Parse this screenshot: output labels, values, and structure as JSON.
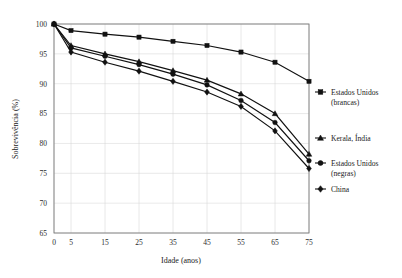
{
  "chart_data": {
    "type": "line",
    "title": "",
    "xlabel": "Idade (anos)",
    "ylabel": "Sobrevivência (%)",
    "xlim": [
      0,
      75
    ],
    "ylim": [
      65,
      100
    ],
    "xticks": [
      0,
      5,
      15,
      25,
      35,
      45,
      55,
      65,
      75
    ],
    "xtick_labels": [
      "0",
      "5",
      "15",
      "25",
      "35",
      "45",
      "55",
      "65",
      "75"
    ],
    "yticks": [
      65,
      70,
      75,
      80,
      85,
      90,
      95,
      100
    ],
    "ytick_labels": [
      "65",
      "70",
      "75",
      "80",
      "85",
      "90",
      "95",
      "100"
    ],
    "grid": true,
    "legend_position": "right",
    "x": [
      0,
      5,
      15,
      25,
      35,
      45,
      55,
      65,
      75
    ],
    "series": [
      {
        "name": "Estados Unidos (brancas)",
        "marker": "square",
        "color": "#111111",
        "values": [
          100,
          98.9,
          98.3,
          97.8,
          97.1,
          96.4,
          95.3,
          93.6,
          90.4
        ]
      },
      {
        "name": "Kerala, Índia",
        "marker": "triangle",
        "color": "#111111",
        "values": [
          100,
          96.4,
          95.0,
          93.7,
          92.2,
          90.6,
          88.3,
          85.0,
          78.2
        ]
      },
      {
        "name": "Estados Unidos (negras)",
        "marker": "circle",
        "color": "#111111",
        "values": [
          100,
          96.0,
          94.6,
          93.2,
          91.6,
          89.8,
          87.2,
          83.5,
          77.1
        ]
      },
      {
        "name": "China",
        "marker": "diamond",
        "color": "#111111",
        "values": [
          100,
          95.3,
          93.6,
          92.1,
          90.4,
          88.6,
          86.2,
          82.1,
          75.8
        ]
      }
    ]
  },
  "legend": {
    "entries": [
      {
        "label_line1": "Estados Unidos",
        "label_line2": "(brancas)",
        "marker": "square"
      },
      {
        "label_line1": "Kerala, Índia",
        "label_line2": "",
        "marker": "triangle"
      },
      {
        "label_line1": "Estados Unidos",
        "label_line2": "(negras)",
        "marker": "circle"
      },
      {
        "label_line1": "China",
        "label_line2": "",
        "marker": "diamond"
      }
    ]
  }
}
